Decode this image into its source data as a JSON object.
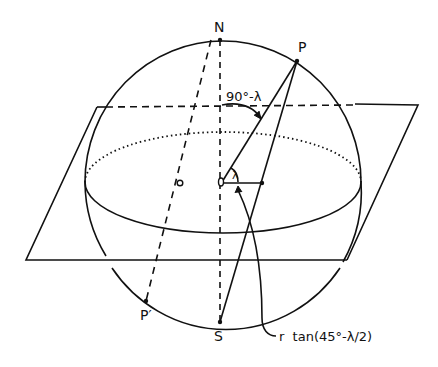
{
  "diagram": {
    "type": "stereographic-projection",
    "labels": {
      "north": "N",
      "south": "S",
      "point": "P",
      "antipode": "P′",
      "colatitude": "90°-λ",
      "latitude": "λ",
      "distance": "r  tan(45°-λ/2)"
    },
    "colors": {
      "ink": "#111111",
      "background": "#ffffff"
    }
  }
}
